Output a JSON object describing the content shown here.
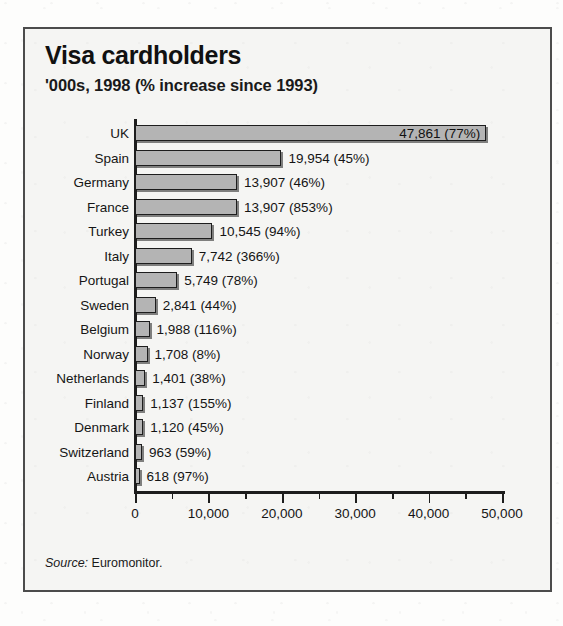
{
  "figure": {
    "title": "Visa cardholders",
    "subtitle": "'000s, 1998 (% increase since 1993)",
    "source_word": "Source:",
    "source_text": " Euromonitor."
  },
  "bleed_through": {
    "line_a": "Consumer transactions",
    "line_b": "Euromonitor",
    "line_c": "1998"
  },
  "colors": {
    "bar_fill": "#b4b4b4",
    "bar_stroke": "#1d1d1d",
    "frame": "#4c4c4c",
    "panel_bg": "#f5f5f3",
    "text": "#141414"
  },
  "chart_data": {
    "type": "bar",
    "orientation": "horizontal",
    "title": "Visa cardholders",
    "subtitle": "'000s, 1998 (% increase since 1993)",
    "xlabel": "",
    "ylabel": "",
    "xlim": [
      0,
      50000
    ],
    "grid": false,
    "legend": null,
    "units": "thousands of cardholders",
    "source": "Source: Euromonitor.",
    "axis_ticks": {
      "major_values": [
        0,
        10000,
        20000,
        30000,
        40000,
        50000
      ],
      "major_labels": [
        "0",
        "10,000",
        "20,000",
        "30,000",
        "40,000",
        "50,000"
      ],
      "minor_values": [
        5000,
        15000,
        25000,
        35000,
        45000
      ]
    },
    "categories": [
      "UK",
      "Spain",
      "Germany",
      "France",
      "Turkey",
      "Italy",
      "Portugal",
      "Sweden",
      "Belgium",
      "Norway",
      "Netherlands",
      "Finland",
      "Denmark",
      "Switzerland",
      "Austria"
    ],
    "values": [
      47861,
      19954,
      13907,
      13907,
      10545,
      7742,
      5749,
      2841,
      1988,
      1708,
      1401,
      1137,
      1120,
      963,
      618
    ],
    "percent_increase": [
      77,
      45,
      46,
      853,
      94,
      366,
      78,
      44,
      116,
      8,
      38,
      155,
      45,
      59,
      97
    ],
    "data_labels": [
      "47,861 (77%)",
      "19,954 (45%)",
      "13,907 (46%)",
      "13,907 (853%)",
      "10,545 (94%)",
      "7,742 (366%)",
      "5,749 (78%)",
      "2,841 (44%)",
      "1,988 (116%)",
      "1,708 (8%)",
      "1,401 (38%)",
      "1,137 (155%)",
      "1,120 (45%)",
      "963 (59%)",
      "618 (97%)"
    ],
    "label_placement": [
      "inside",
      "outside",
      "outside",
      "outside",
      "outside",
      "outside",
      "outside",
      "outside",
      "outside",
      "outside",
      "outside",
      "outside",
      "outside",
      "outside",
      "outside"
    ]
  }
}
